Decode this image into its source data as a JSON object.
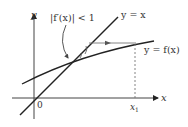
{
  "diagram": {
    "labels": {
      "y_axis": "y",
      "x_axis": "x",
      "origin": "0",
      "x1": "x",
      "x1_sub": "1",
      "condition": "|f′(x)| < 1",
      "line": "y = x",
      "curve": "y = f(x)"
    },
    "colors": {
      "stroke": "#222222",
      "text": "#333333",
      "guide": "#777777"
    }
  }
}
